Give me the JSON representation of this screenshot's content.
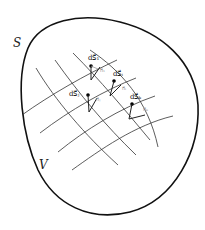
{
  "diagram": {
    "surface_label": "S",
    "volume_label": "V",
    "elements": [
      {
        "area_label": "dS⃗₁",
        "normal_label": "n⃗₁"
      },
      {
        "area_label": "dS⃗ᵢ",
        "normal_label": "n⃗ᵢ"
      },
      {
        "area_label": "dS⃗ⱼ",
        "normal_label": "n⃗ⱼ"
      },
      {
        "area_label": "dS⃗ₖ",
        "normal_label": "n⃗ₖ"
      }
    ],
    "colors": {
      "outline": "#111111",
      "grid": "#333333",
      "normal": "#999999"
    }
  }
}
